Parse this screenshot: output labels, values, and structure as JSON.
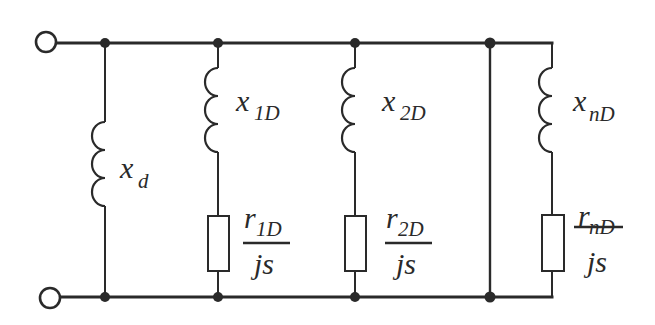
{
  "diagram": {
    "terminals": [
      "top-terminal",
      "bottom-terminal"
    ],
    "branches": [
      {
        "id": "xd",
        "type": "inductor",
        "label_main": "x",
        "label_sub": "d"
      },
      {
        "id": "1",
        "type": "series-RL",
        "inductor": {
          "label_main": "x",
          "label_sub": "1D"
        },
        "resistor": {
          "num_main": "r",
          "num_sub": "1D",
          "den": "js"
        }
      },
      {
        "id": "2",
        "type": "series-RL",
        "inductor": {
          "label_main": "x",
          "label_sub": "2D"
        },
        "resistor": {
          "num_main": "r",
          "num_sub": "2D",
          "den": "js"
        }
      },
      {
        "id": "gap",
        "type": "wire",
        "note": "ellipsis short connection"
      },
      {
        "id": "n",
        "type": "series-RL",
        "inductor": {
          "label_main": "x",
          "label_sub": "nD"
        },
        "resistor": {
          "num_main": "r",
          "num_sub": "nD",
          "den": "js"
        }
      }
    ],
    "colors": {
      "stroke": "#2a2a2a",
      "background": "#ffffff"
    }
  }
}
